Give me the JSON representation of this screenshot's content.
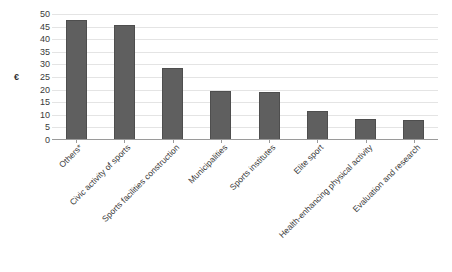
{
  "chart_data": {
    "type": "bar",
    "title": "",
    "xlabel": "",
    "ylabel": "€",
    "ylim": [
      0,
      50
    ],
    "ytick_step": 5,
    "yticks": [
      50,
      45,
      40,
      35,
      30,
      25,
      20,
      15,
      10,
      5,
      0
    ],
    "grid": true,
    "legend": "none",
    "bar_color": "#5f5f5f",
    "gridline_color": "#e4e4e4",
    "axis_color": "#9a9a9a",
    "categories": [
      "Others*",
      "Civic activity of sports",
      "Sports facilities construction",
      "Municipalities",
      "Sports institutes",
      "Elite sport",
      "Health-enhancing physical activity",
      "Evaluation and research"
    ],
    "values": [
      47.5,
      45.5,
      28.5,
      19.5,
      19,
      11.5,
      8.5,
      8
    ]
  }
}
